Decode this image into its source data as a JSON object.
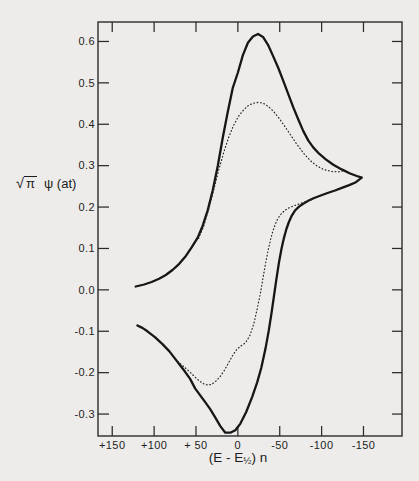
{
  "figure": {
    "background": "#edecea",
    "ink": "#1c1c1c",
    "axis_color": "#2b2b2b"
  },
  "y_axis": {
    "title_sqrt": "√",
    "title_pi": "π",
    "title_rest": "ψ (at)",
    "tick_labels": [
      "0.6",
      "0.5",
      "0.4",
      "0.3",
      "0.2",
      "0.1",
      "0.0",
      "-0.1",
      "-0.2",
      "-0.3"
    ],
    "tick_values": [
      0.6,
      0.5,
      0.4,
      0.3,
      0.2,
      0.1,
      0.0,
      -0.1,
      -0.2,
      -0.3
    ]
  },
  "x_axis": {
    "title_pre": "(E - E",
    "title_sub": "½",
    "title_post": ") n",
    "tick_labels": [
      "+150",
      "+100",
      "+ 50",
      "0",
      "-50",
      "-100",
      "-150"
    ],
    "tick_values": [
      150,
      100,
      50,
      0,
      -50,
      -100,
      -150
    ]
  },
  "chart_data": {
    "type": "line",
    "title": "",
    "xlabel": "(E - E1/2) n, mV",
    "ylabel": "√π ψ (at)",
    "x_axis_reversed": true,
    "xlim": [
      167,
      -196
    ],
    "ylim": [
      -0.353,
      0.647
    ],
    "grid": false,
    "legend": "none",
    "key_features": {
      "solid_peak": {
        "x": -24,
        "y": 0.618
      },
      "solid_trough": {
        "x": 14,
        "y": -0.346
      },
      "dotted_peak": {
        "x": -25,
        "y": 0.453
      },
      "dotted_trough": {
        "x": 33,
        "y": -0.23
      },
      "switching_point": {
        "x": -150,
        "y": 0.27
      }
    },
    "series": [
      {
        "name": "cyclic voltammogram - solid outer curve (forward and reverse sweep)",
        "style": "solid",
        "points": [
          [
            122,
            0.008
          ],
          [
            112,
            0.013
          ],
          [
            103,
            0.019
          ],
          [
            94,
            0.027
          ],
          [
            86,
            0.036
          ],
          [
            78,
            0.048
          ],
          [
            70,
            0.063
          ],
          [
            62,
            0.082
          ],
          [
            55,
            0.103
          ],
          [
            48,
            0.126
          ],
          [
            42,
            0.155
          ],
          [
            36,
            0.192
          ],
          [
            30,
            0.24
          ],
          [
            24,
            0.3
          ],
          [
            18,
            0.368
          ],
          [
            12,
            0.43
          ],
          [
            6,
            0.488
          ],
          [
            0,
            0.525
          ],
          [
            -6,
            0.567
          ],
          [
            -12,
            0.597
          ],
          [
            -18,
            0.612
          ],
          [
            -24,
            0.618
          ],
          [
            -30,
            0.611
          ],
          [
            -36,
            0.592
          ],
          [
            -42,
            0.565
          ],
          [
            -48,
            0.537
          ],
          [
            -54,
            0.506
          ],
          [
            -60,
            0.474
          ],
          [
            -66,
            0.442
          ],
          [
            -72,
            0.412
          ],
          [
            -78,
            0.384
          ],
          [
            -84,
            0.361
          ],
          [
            -90,
            0.344
          ],
          [
            -97,
            0.329
          ],
          [
            -105,
            0.315
          ],
          [
            -114,
            0.302
          ],
          [
            -124,
            0.291
          ],
          [
            -134,
            0.281
          ],
          [
            -142,
            0.275
          ],
          [
            -148,
            0.271
          ],
          [
            -141,
            0.26
          ],
          [
            -133,
            0.253
          ],
          [
            -125,
            0.247
          ],
          [
            -116,
            0.24
          ],
          [
            -107,
            0.234
          ],
          [
            -99,
            0.228
          ],
          [
            -91,
            0.222
          ],
          [
            -84,
            0.215
          ],
          [
            -78,
            0.208
          ],
          [
            -73,
            0.201
          ],
          [
            -68,
            0.191
          ],
          [
            -64,
            0.178
          ],
          [
            -61,
            0.164
          ],
          [
            -58,
            0.147
          ],
          [
            -55,
            0.125
          ],
          [
            -52,
            0.098
          ],
          [
            -49,
            0.065
          ],
          [
            -46,
            0.026
          ],
          [
            -43,
            -0.016
          ],
          [
            -40,
            -0.058
          ],
          [
            -37,
            -0.098
          ],
          [
            -33,
            -0.142
          ],
          [
            -28,
            -0.188
          ],
          [
            -23,
            -0.224
          ],
          [
            -17,
            -0.259
          ],
          [
            -10,
            -0.295
          ],
          [
            -3,
            -0.323
          ],
          [
            3,
            -0.339
          ],
          [
            9,
            -0.345
          ],
          [
            15,
            -0.345
          ],
          [
            21,
            -0.329
          ],
          [
            27,
            -0.308
          ],
          [
            33,
            -0.288
          ],
          [
            39,
            -0.271
          ],
          [
            45,
            -0.255
          ],
          [
            51,
            -0.238
          ],
          [
            57,
            -0.215
          ],
          [
            63,
            -0.198
          ],
          [
            69,
            -0.182
          ],
          [
            75,
            -0.166
          ],
          [
            82,
            -0.148
          ],
          [
            90,
            -0.131
          ],
          [
            99,
            -0.114
          ],
          [
            108,
            -0.1
          ],
          [
            114,
            -0.092
          ],
          [
            120,
            -0.086
          ]
        ]
      },
      {
        "name": "dotted inner curve - upper (cathodic) branch",
        "style": "dotted",
        "points": [
          [
            47,
            0.124
          ],
          [
            41,
            0.152
          ],
          [
            35,
            0.193
          ],
          [
            29,
            0.24
          ],
          [
            23,
            0.288
          ],
          [
            17,
            0.331
          ],
          [
            11,
            0.368
          ],
          [
            5,
            0.398
          ],
          [
            -1,
            0.42
          ],
          [
            -7,
            0.435
          ],
          [
            -13,
            0.446
          ],
          [
            -19,
            0.451
          ],
          [
            -25,
            0.453
          ],
          [
            -31,
            0.45
          ],
          [
            -37,
            0.442
          ],
          [
            -43,
            0.43
          ],
          [
            -49,
            0.415
          ],
          [
            -55,
            0.398
          ],
          [
            -62,
            0.377
          ],
          [
            -70,
            0.353
          ],
          [
            -78,
            0.331
          ],
          [
            -86,
            0.313
          ],
          [
            -94,
            0.3
          ],
          [
            -102,
            0.291
          ],
          [
            -112,
            0.286
          ],
          [
            -120,
            0.285
          ],
          [
            -127,
            0.288
          ]
        ]
      },
      {
        "name": "dotted inner curve - lower (anodic) branch",
        "style": "dotted",
        "points": [
          [
            -88,
            0.218
          ],
          [
            -81,
            0.213
          ],
          [
            -74,
            0.208
          ],
          [
            -67,
            0.203
          ],
          [
            -61,
            0.198
          ],
          [
            -56,
            0.192
          ],
          [
            -52,
            0.184
          ],
          [
            -48,
            0.173
          ],
          [
            -45,
            0.16
          ],
          [
            -42,
            0.143
          ],
          [
            -39,
            0.121
          ],
          [
            -36,
            0.094
          ],
          [
            -33,
            0.063
          ],
          [
            -30,
            0.029
          ],
          [
            -27,
            -0.007
          ],
          [
            -23,
            -0.047
          ],
          [
            -19,
            -0.082
          ],
          [
            -14,
            -0.112
          ],
          [
            -9,
            -0.128
          ],
          [
            -4,
            -0.135
          ],
          [
            1,
            -0.143
          ],
          [
            6,
            -0.158
          ],
          [
            11,
            -0.176
          ],
          [
            16,
            -0.194
          ],
          [
            21,
            -0.209
          ],
          [
            26,
            -0.22
          ],
          [
            31,
            -0.228
          ],
          [
            36,
            -0.23
          ],
          [
            41,
            -0.227
          ],
          [
            46,
            -0.22
          ],
          [
            51,
            -0.211
          ],
          [
            57,
            -0.199
          ],
          [
            63,
            -0.188
          ],
          [
            69,
            -0.178
          ],
          [
            74,
            -0.17
          ]
        ]
      }
    ]
  }
}
